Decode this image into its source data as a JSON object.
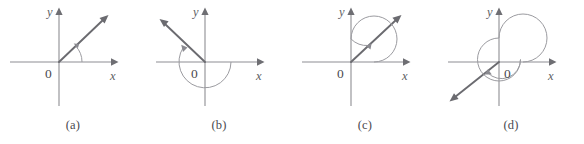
{
  "figure": {
    "kind": "angles-in-standard-position",
    "background_color": "#ffffff",
    "axis_color": "#8e8e93",
    "ray_color": "#6b6b70",
    "arc_color": "#9b9ba0",
    "label_color": "#4a4a4f",
    "panel_width": 146,
    "panel_height": 144,
    "panels": [
      {
        "id": "a",
        "caption": "(a)",
        "y_axis_label": "y",
        "x_axis_label": "x",
        "origin_label": "0",
        "origin": {
          "x": 59,
          "y": 62
        },
        "x_axis": {
          "from_x": 10,
          "to_x": 117
        },
        "y_axis": {
          "from_y": 9,
          "to_y": 106
        },
        "terminal_ray": {
          "angle_deg": 43,
          "length": 66,
          "has_arrowhead": true
        },
        "sweep": {
          "style": "arc",
          "radius": 23,
          "start_deg": 0,
          "end_deg": 43,
          "direction": "counterclockwise",
          "revolutions": 0,
          "has_arrowhead": true
        }
      },
      {
        "id": "b",
        "caption": "(b)",
        "y_axis_label": "y",
        "x_axis_label": "x",
        "origin_label": "0",
        "origin": {
          "x": 205,
          "y": 62
        },
        "x_axis": {
          "from_x": 156,
          "to_x": 263
        },
        "y_axis": {
          "from_y": 9,
          "to_y": 106
        },
        "terminal_ray": {
          "angle_deg": 147,
          "length": 68,
          "has_arrowhead": true
        },
        "sweep": {
          "style": "arc",
          "radius": 26,
          "start_deg": 0,
          "end_deg": -213,
          "direction": "clockwise",
          "revolutions": 0,
          "has_arrowhead": true
        }
      },
      {
        "id": "c",
        "caption": "(c)",
        "y_axis_label": "y",
        "x_axis_label": "x",
        "origin_label": "0",
        "origin": {
          "x": 352,
          "y": 62
        },
        "x_axis": {
          "from_x": 302,
          "to_x": 409
        },
        "y_axis": {
          "from_y": 9,
          "to_y": 106
        },
        "terminal_ray": {
          "angle_deg": 45,
          "length": 68,
          "has_arrowhead": true
        },
        "sweep": {
          "style": "spiral",
          "radius": 23,
          "start_deg": 0,
          "end_deg": 405,
          "direction": "counterclockwise",
          "revolutions": 1,
          "has_arrowhead": true
        }
      },
      {
        "id": "d",
        "caption": "(d)",
        "y_axis_label": "y",
        "x_axis_label": "x",
        "origin_label": "0",
        "origin": {
          "x": 499,
          "y": 62
        },
        "x_axis": {
          "from_x": 448,
          "to_x": 556
        },
        "y_axis": {
          "from_y": 9,
          "to_y": 106
        },
        "terminal_ray": {
          "angle_deg": 218,
          "length": 70,
          "has_arrowhead": true
        },
        "sweep": {
          "style": "spiral",
          "radius": 24,
          "start_deg": 0,
          "end_deg": -502,
          "direction": "clockwise",
          "revolutions": 2,
          "has_arrowhead": true
        }
      }
    ]
  }
}
